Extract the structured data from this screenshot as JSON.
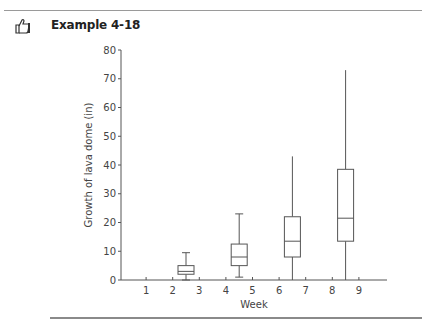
{
  "header": {
    "icon": "thumbs-up-icon",
    "title": "Example 4-18"
  },
  "chart_data": {
    "type": "box",
    "title": "",
    "xlabel": "Week",
    "ylabel": "Growth of lava dome (in)",
    "ylim": [
      0,
      80
    ],
    "xlim": [
      0,
      10
    ],
    "yticks": [
      0,
      10,
      20,
      30,
      40,
      50,
      60,
      70,
      80
    ],
    "xticks": [
      1,
      2,
      3,
      4,
      5,
      6,
      7,
      8,
      9
    ],
    "grid": false,
    "boxes": [
      {
        "x": 2.5,
        "min": 0,
        "q1": 2,
        "median": 3,
        "q3": 5,
        "max": 9.5
      },
      {
        "x": 4.5,
        "min": 1,
        "q1": 5,
        "median": 8,
        "q3": 12.5,
        "max": 23
      },
      {
        "x": 6.5,
        "min": 0,
        "q1": 8,
        "median": 13.5,
        "q3": 22,
        "max": 43
      },
      {
        "x": 8.5,
        "min": 0,
        "q1": 13.5,
        "median": 21.5,
        "q3": 38.5,
        "max": 73
      }
    ]
  },
  "colors": {
    "line": "#555555",
    "rule": "#8a8a8a"
  }
}
